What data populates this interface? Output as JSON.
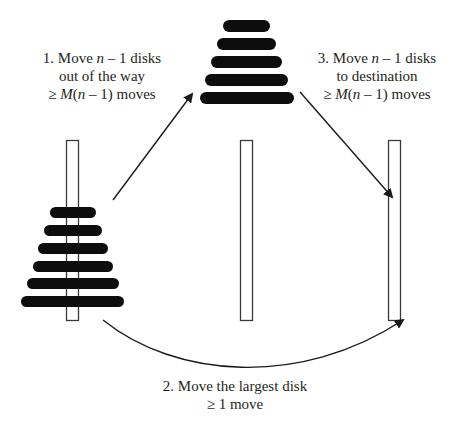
{
  "colors": {
    "disk": "#0d0d0d",
    "peg_stroke": "#3a3a3a",
    "peg_fill": "#ffffff",
    "arrow": "#1a1a1a",
    "text": "#231f20"
  },
  "steps": [
    {
      "id": "step1",
      "line1_prefix": "1. Move ",
      "line1_var": "n",
      "line1_suffix": " – 1 disks",
      "line2": "out of the way",
      "line3_prefix": "≥ ",
      "line3_var": "M",
      "line3_mid": "(",
      "line3_var2": "n",
      "line3_suffix": " – 1) moves"
    },
    {
      "id": "step2",
      "line1": "2. Move the largest disk",
      "line2": "≥ 1 move"
    },
    {
      "id": "step3",
      "line1_prefix": "3. Move ",
      "line1_var": "n",
      "line1_suffix": " – 1 disks",
      "line2": "to destination",
      "line3_prefix": "≥ ",
      "line3_var": "M",
      "line3_mid": "(",
      "line3_var2": "n",
      "line3_suffix": " – 1) moves"
    }
  ],
  "pegs": [
    {
      "name": "source",
      "x": 66,
      "y": 140,
      "w": 12,
      "h": 180
    },
    {
      "name": "auxiliary",
      "x": 240,
      "y": 140,
      "w": 12,
      "h": 180
    },
    {
      "name": "destination",
      "x": 388,
      "y": 140,
      "w": 12,
      "h": 180
    }
  ],
  "left_stack_disks": [
    {
      "x": 50,
      "y": 207,
      "w": 46,
      "h": 11
    },
    {
      "x": 44,
      "y": 225,
      "w": 58,
      "h": 11
    },
    {
      "x": 38,
      "y": 243,
      "w": 70,
      "h": 11
    },
    {
      "x": 33,
      "y": 261,
      "w": 80,
      "h": 11
    },
    {
      "x": 27,
      "y": 278,
      "w": 92,
      "h": 11
    },
    {
      "x": 21,
      "y": 296,
      "w": 103,
      "h": 11
    }
  ],
  "top_stack_disks": [
    {
      "x": 223,
      "y": 20,
      "w": 47,
      "h": 12
    },
    {
      "x": 217,
      "y": 38,
      "w": 59,
      "h": 12
    },
    {
      "x": 211,
      "y": 56,
      "w": 71,
      "h": 12
    },
    {
      "x": 205,
      "y": 74,
      "w": 83,
      "h": 12
    },
    {
      "x": 200,
      "y": 92,
      "w": 94,
      "h": 12
    }
  ],
  "arrows": [
    {
      "name": "step1-arrow",
      "path": "M113,200 L188,99",
      "head": "193,92"
    },
    {
      "name": "step3-arrow",
      "path": "M300,92 L388,193",
      "head": "393,199"
    },
    {
      "name": "step2-arrow",
      "path": "M103,320 C170,375 300,385 398,323",
      "head": "405,319"
    }
  ]
}
